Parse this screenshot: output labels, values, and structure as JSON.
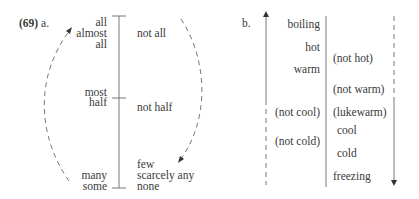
{
  "example_number": "(69)",
  "panel_a": {
    "label": "a.",
    "left_column": [
      "all",
      "almost",
      "all",
      "most",
      "half",
      "many",
      "some"
    ],
    "right_column": [
      "not all",
      "not half",
      "few",
      "scarcely any",
      "none"
    ]
  },
  "panel_b": {
    "label": "b.",
    "left_column": [
      "boiling",
      "hot",
      "warm",
      "(not cool)",
      "(not cold)"
    ],
    "right_column": [
      "(not hot)",
      "(not warm)",
      "(lukewarm)",
      "cool",
      "cold",
      "freezing"
    ]
  },
  "colors": {
    "line": "#555555",
    "text": "#3a3a3a"
  }
}
